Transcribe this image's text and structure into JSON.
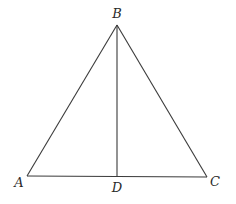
{
  "figure": {
    "type": "triangle with altitude/median",
    "points": {
      "A": {
        "label": "A",
        "x": 27,
        "y": 176
      },
      "B": {
        "label": "B",
        "x": 117,
        "y": 25
      },
      "C": {
        "label": "C",
        "x": 207,
        "y": 177
      },
      "D": {
        "label": "D",
        "x": 117,
        "y": 176.5
      }
    },
    "segments": [
      {
        "name": "AB",
        "from": "A",
        "to": "B"
      },
      {
        "name": "BC",
        "from": "B",
        "to": "C"
      },
      {
        "name": "AC",
        "from": "A",
        "to": "C"
      },
      {
        "name": "BD",
        "from": "B",
        "to": "D"
      }
    ],
    "label_positions": {
      "A": {
        "x": 19,
        "y": 187
      },
      "B": {
        "x": 117,
        "y": 18
      },
      "C": {
        "x": 215,
        "y": 186
      },
      "D": {
        "x": 117,
        "y": 192
      }
    },
    "colors": {
      "stroke": "#3a3a3a",
      "text": "#2a2a2a",
      "background": "#ffffff"
    }
  }
}
